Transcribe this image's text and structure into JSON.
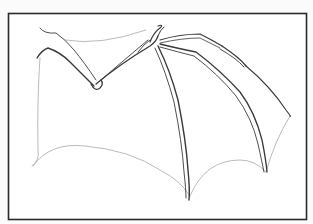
{
  "image": {
    "subject": "Bat wing line drawing",
    "caption": "Bat wing sketch in rectangular frame"
  },
  "colors": {
    "background": "#fbfbfb",
    "frame_fill": "#ffffff",
    "frame_stroke": "#2a2a2a",
    "bone_stroke": "#3a3a3a",
    "membrane_stroke": "#a8a8a8"
  }
}
